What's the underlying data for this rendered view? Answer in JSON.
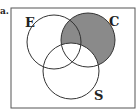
{
  "question_label": "a.",
  "diagram": {
    "sets": [
      {
        "name": "E",
        "label": "E"
      },
      {
        "name": "C",
        "label": "C"
      },
      {
        "name": "S",
        "label": "S"
      }
    ],
    "shaded_region": "C minus S",
    "shade_color": "#8a8a8a",
    "stroke_color": "#333333"
  }
}
